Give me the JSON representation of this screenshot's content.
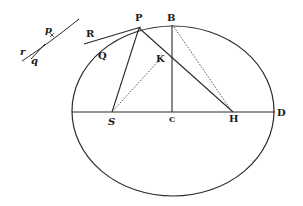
{
  "diagram": {
    "type": "geometric-figure",
    "stroke_color": "#2a2a2a",
    "labels": {
      "P": "P",
      "B": "B",
      "K": "K",
      "R": "R",
      "Q": "Q",
      "S": "S",
      "C": "C",
      "H": "H",
      "D": "D",
      "p_small": "p",
      "r_small": "r",
      "q_small": "q"
    },
    "points": {
      "P": [
        139,
        28
      ],
      "B": [
        172,
        25
      ],
      "K": [
        166,
        55
      ],
      "S": [
        112,
        112
      ],
      "C": [
        172,
        112
      ],
      "H": [
        233,
        112
      ],
      "D": [
        274,
        112
      ]
    },
    "ellipse": {
      "cx": 173,
      "cy": 111,
      "rx": 101,
      "ry": 85
    },
    "solid_lines": [
      [
        "P",
        "S"
      ],
      [
        "P",
        "H"
      ],
      [
        "B",
        "C"
      ],
      [
        "A",
        "D"
      ],
      [
        "R",
        "P"
      ]
    ],
    "dotted_lines": [
      [
        "S",
        "K"
      ],
      [
        "B",
        "H"
      ]
    ]
  }
}
